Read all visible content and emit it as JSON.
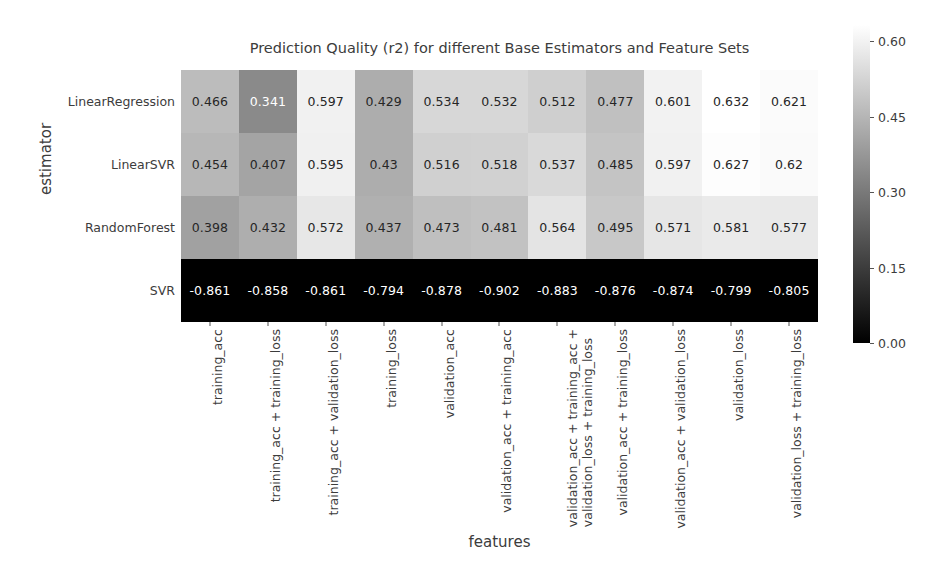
{
  "chart_data": {
    "type": "heatmap",
    "title": "Prediction Quality (r2) for different Base Estimators and Feature Sets",
    "xlabel": "features",
    "ylabel": "estimator",
    "colormap": "gray",
    "grid": false,
    "legend_position": "right-colorbar",
    "colorbar": {
      "ticks": [
        0.6,
        0.45,
        0.3,
        0.15,
        0.0
      ],
      "tick_labels": [
        "0.60",
        "0.45",
        "0.30",
        "0.15",
        "0.00"
      ],
      "vmin": 0.0,
      "vmax": 0.632,
      "low_color": "#000000",
      "high_color": "#ffffff"
    },
    "y_categories": [
      "LinearRegression",
      "LinearSVR",
      "RandomForest",
      "SVR"
    ],
    "x_categories": [
      "training_acc",
      "training_acc + training_loss",
      "training_acc + validation_loss",
      "training_loss",
      "validation_acc",
      "validation_acc + training_acc",
      "validation_acc + training_acc +\nvalidation_loss + training_loss",
      "validation_acc + training_loss",
      "validation_acc + validation_loss",
      "validation_loss",
      "validation_loss + training_loss"
    ],
    "x_categories_display": [
      [
        "training_acc"
      ],
      [
        "training_acc + training_loss"
      ],
      [
        "training_acc + validation_loss"
      ],
      [
        "training_loss"
      ],
      [
        "validation_acc"
      ],
      [
        "validation_acc + training_acc"
      ],
      [
        "validation_acc + training_acc +",
        "validation_loss + training_loss"
      ],
      [
        "validation_acc + training_loss"
      ],
      [
        "validation_acc + validation_loss"
      ],
      [
        "validation_loss"
      ],
      [
        "validation_loss + training_loss"
      ]
    ],
    "series": [
      {
        "name": "LinearRegression",
        "values": [
          0.466,
          0.341,
          0.597,
          0.429,
          0.534,
          0.532,
          0.512,
          0.477,
          0.601,
          0.632,
          0.621
        ],
        "labels": [
          "0.466",
          "0.341",
          "0.597",
          "0.429",
          "0.534",
          "0.532",
          "0.512",
          "0.477",
          "0.601",
          "0.632",
          "0.621"
        ]
      },
      {
        "name": "LinearSVR",
        "values": [
          0.454,
          0.407,
          0.595,
          0.43,
          0.516,
          0.518,
          0.537,
          0.485,
          0.597,
          0.627,
          0.62
        ],
        "labels": [
          "0.454",
          "0.407",
          "0.595",
          "0.43",
          "0.516",
          "0.518",
          "0.537",
          "0.485",
          "0.597",
          "0.627",
          "0.62"
        ]
      },
      {
        "name": "RandomForest",
        "values": [
          0.398,
          0.432,
          0.572,
          0.437,
          0.473,
          0.481,
          0.564,
          0.495,
          0.571,
          0.581,
          0.577
        ],
        "labels": [
          "0.398",
          "0.432",
          "0.572",
          "0.437",
          "0.473",
          "0.481",
          "0.564",
          "0.495",
          "0.571",
          "0.581",
          "0.577"
        ]
      },
      {
        "name": "SVR",
        "values": [
          -0.861,
          -0.858,
          -0.861,
          -0.794,
          -0.878,
          -0.902,
          -0.883,
          -0.876,
          -0.874,
          -0.799,
          -0.805
        ],
        "labels": [
          "-0.861",
          "-0.858",
          "-0.861",
          "-0.794",
          "-0.878",
          "-0.902",
          "-0.883",
          "-0.876",
          "-0.874",
          "-0.799",
          "-0.805"
        ]
      }
    ]
  }
}
